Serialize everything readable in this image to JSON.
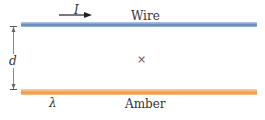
{
  "diagram": {
    "wire": {
      "label": "Wire",
      "color": "#7f9fca"
    },
    "amber": {
      "label": "Amber",
      "color": "#f2a865"
    },
    "current_label": "I",
    "distance_label": "d",
    "charge_density_label": "λ",
    "point_marker": "×"
  }
}
